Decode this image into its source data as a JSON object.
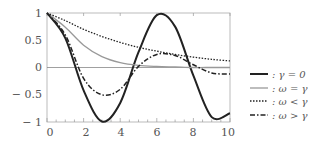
{
  "chart_data": {
    "type": "line",
    "title": "",
    "xlabel": "",
    "ylabel": "",
    "xlim": [
      0,
      10
    ],
    "ylim": [
      -1,
      1
    ],
    "xticks": [
      "0",
      "2",
      "4",
      "6",
      "8",
      "10"
    ],
    "yticks": [
      "1",
      "0.5",
      "0",
      "− 0.5",
      "− 1"
    ],
    "legend_position": "right",
    "x": [
      0,
      1,
      2,
      3,
      4,
      5,
      6,
      7,
      8,
      9,
      10
    ],
    "series": [
      {
        "name": ": γ = 0",
        "style": "solid-thick-black",
        "values": [
          1.0,
          0.54,
          -0.42,
          -0.99,
          -0.65,
          0.28,
          0.96,
          0.75,
          -0.15,
          -0.91,
          -0.84
        ]
      },
      {
        "name": ": ω = γ",
        "style": "solid-gray",
        "values": [
          1.0,
          0.74,
          0.41,
          0.2,
          0.09,
          0.04,
          0.02,
          0.01,
          0.0,
          0.0,
          0.0
        ]
      },
      {
        "name": ": ω < γ",
        "style": "dotted",
        "values": [
          1.0,
          0.86,
          0.7,
          0.57,
          0.46,
          0.37,
          0.3,
          0.24,
          0.19,
          0.15,
          0.12
        ]
      },
      {
        "name": ": ω > γ",
        "style": "dash-dot",
        "values": [
          1.0,
          0.6,
          -0.2,
          -0.5,
          -0.4,
          0.02,
          0.24,
          0.22,
          0.05,
          -0.1,
          -0.12
        ]
      }
    ]
  },
  "legend": [
    {
      "label": ": γ = 0"
    },
    {
      "label": ": ω = γ"
    },
    {
      "label": ": ω < γ"
    },
    {
      "label": ": ω > γ"
    }
  ]
}
